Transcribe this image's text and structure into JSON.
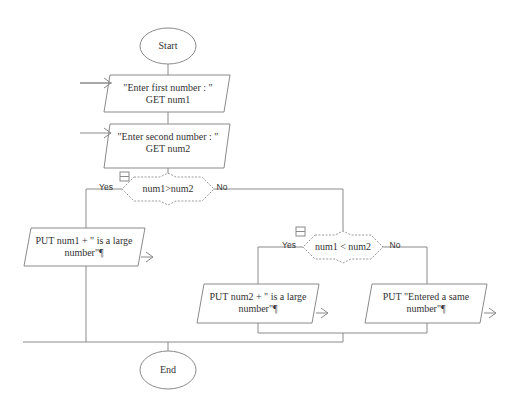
{
  "diagram": {
    "type": "flowchart",
    "nodes": {
      "start": {
        "label": "Start"
      },
      "input1": {
        "line1": "\"Enter first number : \"",
        "line2": "GET num1"
      },
      "input2": {
        "line1": "\"Enter second number : \"",
        "line2": "GET num2"
      },
      "decision1": {
        "label": "num1>num2",
        "yes": "Yes",
        "no": "No"
      },
      "output1": {
        "line1": "PUT num1  +  \" is a large",
        "line2": "number\"¶"
      },
      "decision2": {
        "label": "num1 < num2",
        "yes": "Yes",
        "no": "No"
      },
      "output2": {
        "line1": "PUT num2  +  \" is a large",
        "line2": "number\"¶"
      },
      "output3": {
        "line1": "PUT \"Entered a same",
        "line2": "number\"¶"
      },
      "end": {
        "label": "End"
      }
    },
    "colors": {
      "line": "#8a8a8a",
      "text": "#333333",
      "background": "#ffffff"
    }
  }
}
